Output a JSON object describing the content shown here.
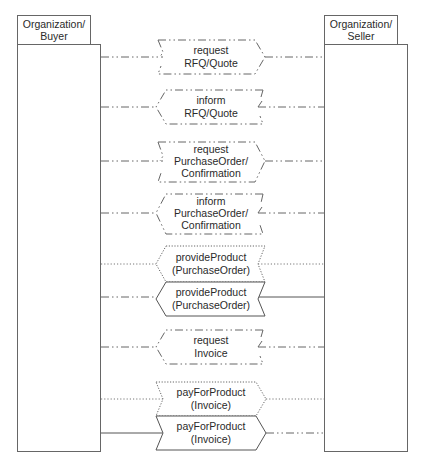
{
  "diagram": {
    "type": "sequence-protocol",
    "colors": {
      "stroke": "#555555",
      "text": "#2a2a2a",
      "background": "#ffffff"
    },
    "lifelines": [
      {
        "id": "buyer",
        "label_line1": "Organization/",
        "label_line2": "Buyer"
      },
      {
        "id": "seller",
        "label_line1": "Organization/",
        "label_line2": "Seller"
      }
    ],
    "messages": [
      {
        "line1": "request",
        "line2": "RFQ/Quote",
        "line3": "",
        "kind": "request",
        "direction": "buyer-to-seller",
        "style": "dash-dot"
      },
      {
        "line1": "inform",
        "line2": "RFQ/Quote",
        "line3": "",
        "kind": "inform",
        "direction": "seller-to-buyer",
        "style": "dash-dot"
      },
      {
        "line1": "request",
        "line2": "PurchaseOrder/",
        "line3": "Confirmation",
        "kind": "request",
        "direction": "buyer-to-seller",
        "style": "dash-dot"
      },
      {
        "line1": "inform",
        "line2": "PurchaseOrder/",
        "line3": "Confirmation",
        "kind": "inform",
        "direction": "seller-to-buyer",
        "style": "dash-dot"
      },
      {
        "line1": "provideProduct",
        "line2": "(PurchaseOrder)",
        "line3": "",
        "kind": "commitment",
        "direction": "seller-to-buyer",
        "style": "dotted"
      },
      {
        "line1": "provideProduct",
        "line2": "(PurchaseOrder)",
        "line3": "",
        "kind": "action",
        "direction": "seller-to-buyer",
        "style": "solid"
      },
      {
        "line1": "request",
        "line2": "Invoice",
        "line3": "",
        "kind": "inform",
        "direction": "seller-to-buyer",
        "style": "dash-dot"
      },
      {
        "line1": "payForProduct",
        "line2": "(Invoice)",
        "line3": "",
        "kind": "commitment",
        "direction": "buyer-to-seller",
        "style": "dotted"
      },
      {
        "line1": "payForProduct",
        "line2": "(Invoice)",
        "line3": "",
        "kind": "action",
        "direction": "buyer-to-seller",
        "style": "solid"
      }
    ]
  }
}
